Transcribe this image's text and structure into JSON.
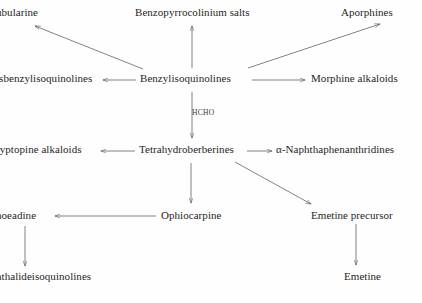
{
  "diagram": {
    "type": "biosynthetic-pathway-flow-diagram",
    "title": "",
    "background_color": "#fefefe",
    "text_color": "#262524",
    "line_color": "#55524e",
    "nodes": [
      {
        "id": "tubocurarine",
        "label": "ubularine",
        "x": -4,
        "y": 6,
        "clipped": true
      },
      {
        "id": "benzopyrrocolinium",
        "label": "Benzopyrrocolinium salts",
        "x": 135,
        "y": 6,
        "clipped": false
      },
      {
        "id": "aporphines",
        "label": "Aporphines",
        "x": 341,
        "y": 6,
        "clipped": false
      },
      {
        "id": "bisbenzylisoquinolines",
        "label": "isbenzylisoquinolines",
        "x": -4,
        "y": 72,
        "clipped": true
      },
      {
        "id": "benzylisoquinolines",
        "label": "Benzylisoquinolines",
        "x": 140,
        "y": 72,
        "clipped": false
      },
      {
        "id": "morphine_alkaloids",
        "label": "Morphine alkaloids",
        "x": 311,
        "y": 72,
        "clipped": false
      },
      {
        "id": "cryptopine_alkaloids",
        "label": "ryptopine alkaloids",
        "x": -4,
        "y": 143,
        "clipped": true
      },
      {
        "id": "tetrahydroberberines",
        "label": "Tetrahydroberberines",
        "x": 139,
        "y": 143,
        "clipped": false
      },
      {
        "id": "naphthaphenanthridines",
        "label": "α-Naphthaphenanthridines",
        "x": 276,
        "y": 143,
        "clipped": false
      },
      {
        "id": "rhoeadine",
        "label": "hoeadine",
        "x": -4,
        "y": 209,
        "clipped": true
      },
      {
        "id": "ophiocarpine",
        "label": "Ophiocarpine",
        "x": 161,
        "y": 209,
        "clipped": false
      },
      {
        "id": "emetine_precursor",
        "label": "Emetine precursor",
        "x": 311,
        "y": 209,
        "clipped": false
      },
      {
        "id": "phthalideisoquinolines",
        "label": "hthalideisoquinolines",
        "x": -4,
        "y": 270,
        "clipped": true
      },
      {
        "id": "emetine",
        "label": "Emetine",
        "x": 344,
        "y": 270,
        "clipped": false
      }
    ],
    "edge_labels": [
      {
        "id": "hcho",
        "label": "HCHO",
        "x": 192,
        "y": 108
      }
    ],
    "edges": [
      {
        "from": "benzylisoquinolines",
        "to": "tubocurarine",
        "label": ""
      },
      {
        "from": "benzylisoquinolines",
        "to": "benzopyrrocolinium",
        "label": ""
      },
      {
        "from": "benzylisoquinolines",
        "to": "aporphines",
        "label": ""
      },
      {
        "from": "benzylisoquinolines",
        "to": "bisbenzylisoquinolines",
        "label": ""
      },
      {
        "from": "benzylisoquinolines",
        "to": "morphine_alkaloids",
        "label": ""
      },
      {
        "from": "benzylisoquinolines",
        "to": "tetrahydroberberines",
        "label": "HCHO"
      },
      {
        "from": "tetrahydroberberines",
        "to": "cryptopine_alkaloids",
        "label": ""
      },
      {
        "from": "tetrahydroberberines",
        "to": "naphthaphenanthridines",
        "label": ""
      },
      {
        "from": "tetrahydroberberines",
        "to": "ophiocarpine",
        "label": ""
      },
      {
        "from": "tetrahydroberberines",
        "to": "emetine_precursor",
        "label": ""
      },
      {
        "from": "ophiocarpine",
        "to": "rhoeadine",
        "label": ""
      },
      {
        "from": "rhoeadine",
        "to": "phthalideisoquinolines",
        "label": ""
      },
      {
        "from": "emetine_precursor",
        "to": "emetine",
        "label": ""
      }
    ]
  }
}
